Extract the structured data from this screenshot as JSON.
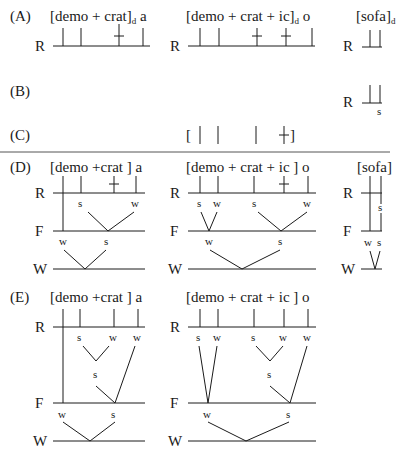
{
  "figure": {
    "colors": {
      "ink": "#1a1a1a",
      "background": "#ffffff",
      "divider": "#555555"
    },
    "tiers": {
      "root": "R",
      "foot": "F",
      "word": "W"
    },
    "panels": {
      "A": {
        "label": "(A)",
        "forms": [
          {
            "text": "[demo + crat]",
            "subscript": "d",
            "suffix": "a"
          },
          {
            "text": "[demo + crat + ic]",
            "subscript": "d",
            "suffix": "o"
          },
          {
            "text": "[sofa]",
            "subscript": "d",
            "suffix": ""
          }
        ]
      },
      "B": {
        "label": "(B)",
        "stress": "s"
      },
      "C": {
        "label": "(C)",
        "grid": "[ |  |    |   + ]"
      },
      "D": {
        "label": "(D)",
        "forms": [
          {
            "text": "[demo +crat ] a",
            "root_marks": [
              "s",
              "w"
            ],
            "foot_marks": [
              "w",
              "s"
            ]
          },
          {
            "text": "[demo + crat + ic ] o",
            "root_marks": [
              "s",
              "w",
              "s",
              "w"
            ],
            "foot_marks": [
              "w",
              "s"
            ]
          },
          {
            "text": "[sofa]",
            "root_marks": [
              "s"
            ],
            "foot_marks": [
              "w",
              "s"
            ]
          }
        ]
      },
      "E": {
        "label": "(E)",
        "forms": [
          {
            "text": "[demo +crat ] a",
            "root_marks": [
              "s",
              "w",
              "w"
            ],
            "mid_mark": "s",
            "foot_marks": [
              "w",
              "s"
            ]
          },
          {
            "text": "[demo + crat + ic ] o",
            "root_marks": [
              "s",
              "w",
              "s",
              "w",
              "w"
            ],
            "mid_mark": "s",
            "foot_marks": [
              "w",
              "s"
            ]
          }
        ]
      }
    }
  }
}
